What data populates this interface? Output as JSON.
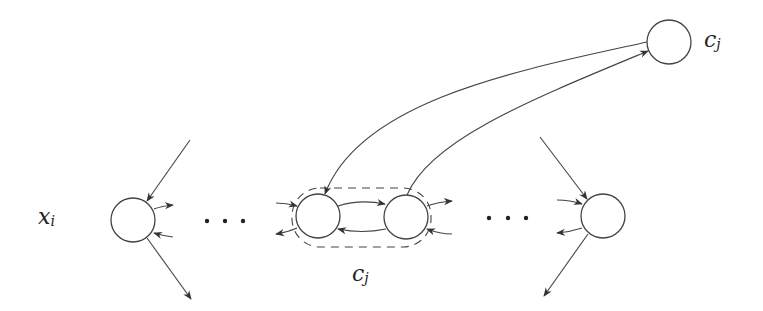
{
  "diagram": {
    "type": "graph",
    "labels": {
      "left_node": {
        "base": "x",
        "sub": "i"
      },
      "cluster": {
        "base": "c",
        "sub": "j"
      },
      "top_node": {
        "base": "c",
        "sub": "j"
      }
    },
    "nodes": [
      {
        "id": "xi",
        "cx": 133,
        "cy": 220,
        "r": 22
      },
      {
        "id": "a",
        "cx": 318,
        "cy": 216,
        "r": 22
      },
      {
        "id": "b",
        "cx": 406,
        "cy": 217,
        "r": 22
      },
      {
        "id": "right",
        "cx": 603,
        "cy": 216,
        "r": 22
      },
      {
        "id": "cj_top",
        "cx": 669,
        "cy": 42,
        "r": 22
      }
    ],
    "ellipsis": [
      "…",
      "…"
    ],
    "colors": {
      "stroke": "#444444",
      "background": "#ffffff"
    }
  }
}
